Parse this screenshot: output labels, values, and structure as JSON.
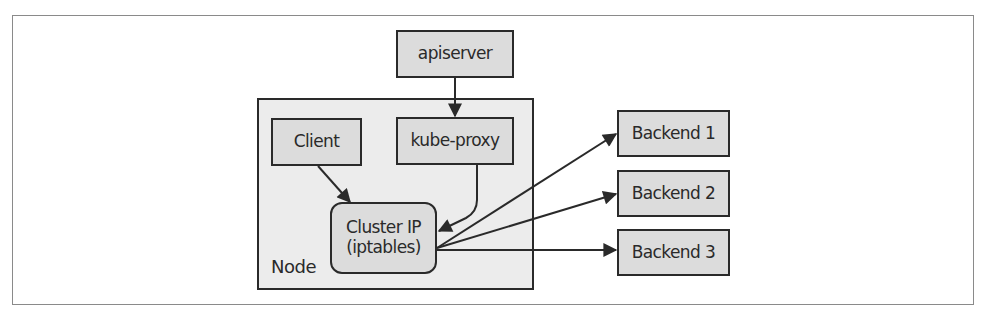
{
  "diagram": {
    "nodes": {
      "apiserver": {
        "label": "apiserver"
      },
      "node_group": {
        "label": "Node"
      },
      "client": {
        "label": "Client"
      },
      "kube_proxy": {
        "label": "kube-proxy"
      },
      "cluster_ip": {
        "line1": "Cluster IP",
        "line2": "(iptables)"
      },
      "backends": [
        {
          "label": "Backend 1"
        },
        {
          "label": "Backend 2"
        },
        {
          "label": "Backend 3"
        }
      ]
    },
    "edges": [
      {
        "from": "apiserver",
        "to": "kube-proxy"
      },
      {
        "from": "Client",
        "to": "Cluster IP"
      },
      {
        "from": "kube-proxy",
        "to": "Cluster IP"
      },
      {
        "from": "Cluster IP",
        "to": "Backend 1"
      },
      {
        "from": "Cluster IP",
        "to": "Backend 2"
      },
      {
        "from": "Cluster IP",
        "to": "Backend 3"
      }
    ],
    "colors": {
      "box_fill": "#dcdcdc",
      "group_fill": "#ececec",
      "stroke": "#2a2a2a",
      "frame": "#8a8a8a"
    }
  }
}
